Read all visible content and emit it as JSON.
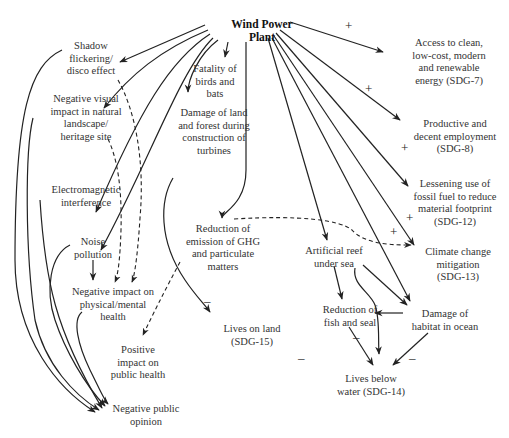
{
  "diagram": {
    "root": {
      "id": "wpp",
      "label": "Wind Power\nPlant",
      "x": 222,
      "y": 18,
      "w": 80
    },
    "nodes": [
      {
        "id": "shadow",
        "label": "Shadow\nflickering/\ndisco effect",
        "x": 56,
        "y": 40,
        "w": 70
      },
      {
        "id": "visual",
        "label": "Negative visual\nimpact in natural\nlandscape/\nheritage site",
        "x": 36,
        "y": 93,
        "w": 100
      },
      {
        "id": "emi",
        "label": "Electromagnetic\ninterference",
        "x": 36,
        "y": 184,
        "w": 100
      },
      {
        "id": "noise",
        "label": "Noise\npollution",
        "x": 68,
        "y": 236,
        "w": 70
      },
      {
        "id": "physmental",
        "label": "Negative impact on\nphysical/mental\nhealth",
        "x": 58,
        "y": 286,
        "w": 110
      },
      {
        "id": "posheath",
        "label": "Positive\nimpact on\npublic health",
        "x": 100,
        "y": 344,
        "w": 76
      },
      {
        "id": "opinion",
        "label": "Negative public\nopinion",
        "x": 104,
        "y": 403,
        "w": 84
      },
      {
        "id": "birds",
        "label": "Fatality of\nbirds and\nbats",
        "x": 180,
        "y": 63,
        "w": 70
      },
      {
        "id": "damageland",
        "label": "Damage of land\nand forest during\nconstruction of\nturbines",
        "x": 162,
        "y": 107,
        "w": 104
      },
      {
        "id": "ghg",
        "label": "Reduction of\nemission of GHG\nand particulate\nmatters",
        "x": 171,
        "y": 223,
        "w": 104
      },
      {
        "id": "land",
        "label": "Lives on land\n(SDG-15)",
        "x": 212,
        "y": 323,
        "w": 80
      },
      {
        "id": "sdg7",
        "label": "Access to clean,\nlow-cost, modern\nand renewable\nenergy (SDG-7)",
        "x": 397,
        "y": 37,
        "w": 104
      },
      {
        "id": "sdg8",
        "label": "Productive and\ndecent employment\n(SDG-8)",
        "x": 401,
        "y": 118,
        "w": 108
      },
      {
        "id": "sdg12",
        "label": "Lessening use of\nfossil fuel to reduce\nmaterial footprint\n(SDG-12)",
        "x": 403,
        "y": 178,
        "w": 108
      },
      {
        "id": "sdg13",
        "label": "Climate change\nmitigation\n(SDG-13)",
        "x": 413,
        "y": 246,
        "w": 90
      },
      {
        "id": "reef",
        "label": "Artificial reef\nunder sea",
        "x": 294,
        "y": 245,
        "w": 80
      },
      {
        "id": "fish",
        "label": "Reduction of\nfish and seal",
        "x": 312,
        "y": 304,
        "w": 76
      },
      {
        "id": "habitat",
        "label": "Damage of\nhabitat in ocean",
        "x": 397,
        "y": 308,
        "w": 96
      },
      {
        "id": "water",
        "label": "Lives below\nwater (SDG-14)",
        "x": 326,
        "y": 373,
        "w": 90
      }
    ],
    "signs": [
      {
        "symbol": "+",
        "x": 345,
        "y": 19
      },
      {
        "symbol": "+",
        "x": 365,
        "y": 82
      },
      {
        "symbol": "+",
        "x": 401,
        "y": 141
      },
      {
        "symbol": "+",
        "x": 406,
        "y": 211
      },
      {
        "symbol": "+",
        "x": 390,
        "y": 225
      },
      {
        "symbol": "–",
        "x": 204,
        "y": 294
      },
      {
        "symbol": "–",
        "x": 353,
        "y": 330
      },
      {
        "symbol": "–",
        "x": 298,
        "y": 351
      },
      {
        "symbol": "–",
        "x": 409,
        "y": 351
      }
    ],
    "colors": {
      "line": "#222222",
      "text": "#333333",
      "background": "#ffffff"
    }
  }
}
